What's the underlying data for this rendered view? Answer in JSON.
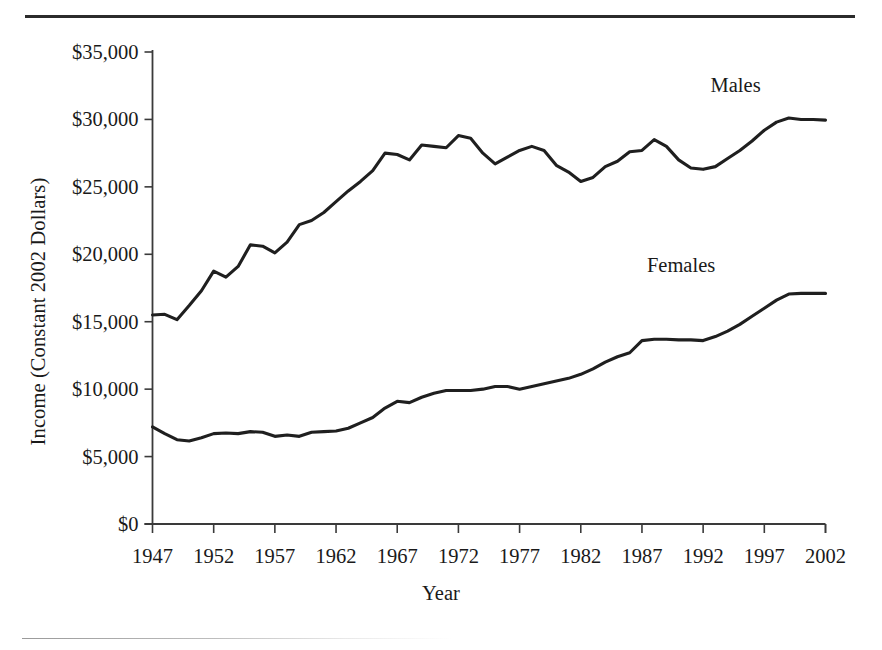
{
  "figure": {
    "has_top_rule": true,
    "has_bottom_rule": true,
    "line_color": "#1f1f1f",
    "axis_color": "#3a3a3a",
    "background": "#ffffff"
  },
  "chart_data": {
    "type": "line",
    "title": "",
    "xlabel": "Year",
    "ylabel": "Income (Constant 2002 Dollars)",
    "xlim": [
      1947,
      2002
    ],
    "ylim": [
      0,
      35000
    ],
    "xticks": [
      1947,
      1952,
      1957,
      1962,
      1967,
      1972,
      1977,
      1982,
      1987,
      1992,
      1997,
      2002
    ],
    "xtick_labels": [
      "1947",
      "1952",
      "1957",
      "1962",
      "1967",
      "1972",
      "1977",
      "1982",
      "1987",
      "1992",
      "1997",
      "2002"
    ],
    "yticks": [
      0,
      5000,
      10000,
      15000,
      20000,
      25000,
      30000,
      35000
    ],
    "ytick_labels": [
      "$0",
      "$5,000",
      "$10,000",
      "$15,000",
      "$20,000",
      "$25,000",
      "$30,000",
      "$35,000"
    ],
    "grid": false,
    "legend_position": "inline-annotations",
    "annotations": [
      {
        "text": "Males",
        "x": 1996.2,
        "y": 32450
      },
      {
        "text": "Females",
        "x": 1991.0,
        "y": 19100
      }
    ],
    "x": [
      1947,
      1948,
      1949,
      1950,
      1951,
      1952,
      1953,
      1954,
      1955,
      1956,
      1957,
      1958,
      1959,
      1960,
      1961,
      1962,
      1963,
      1964,
      1965,
      1966,
      1967,
      1968,
      1969,
      1970,
      1971,
      1972,
      1973,
      1974,
      1975,
      1976,
      1977,
      1978,
      1979,
      1980,
      1981,
      1982,
      1983,
      1984,
      1985,
      1986,
      1987,
      1988,
      1989,
      1990,
      1991,
      1992,
      1993,
      1994,
      1995,
      1996,
      1997,
      1998,
      1999,
      2000,
      2001,
      2002
    ],
    "series": [
      {
        "name": "Males",
        "values": [
          15500,
          15550,
          15150,
          16200,
          17300,
          18750,
          18300,
          19100,
          20700,
          20600,
          20100,
          20900,
          22200,
          22500,
          23100,
          23900,
          24700,
          25400,
          26200,
          27500,
          27400,
          27000,
          28100,
          28000,
          27900,
          28800,
          28600,
          27500,
          26700,
          27200,
          27700,
          28000,
          27700,
          26600,
          26100,
          25400,
          25700,
          26500,
          26900,
          27600,
          27700,
          28500,
          28000,
          27000,
          26400,
          26300,
          26500,
          27100,
          27700,
          28400,
          29200,
          29800,
          30100,
          30000,
          30000,
          29950
        ]
      },
      {
        "name": "Females",
        "values": [
          7200,
          6700,
          6250,
          6150,
          6400,
          6700,
          6750,
          6700,
          6850,
          6800,
          6500,
          6600,
          6500,
          6800,
          6850,
          6900,
          7100,
          7500,
          7900,
          8600,
          9100,
          9000,
          9400,
          9700,
          9900,
          9900,
          9900,
          10000,
          10200,
          10200,
          10000,
          10200,
          10400,
          10600,
          10800,
          11100,
          11500,
          12000,
          12400,
          12700,
          13600,
          13700,
          13700,
          13650,
          13650,
          13600,
          13900,
          14300,
          14800,
          15400,
          16000,
          16600,
          17050,
          17100,
          17100,
          17100
        ]
      }
    ]
  }
}
